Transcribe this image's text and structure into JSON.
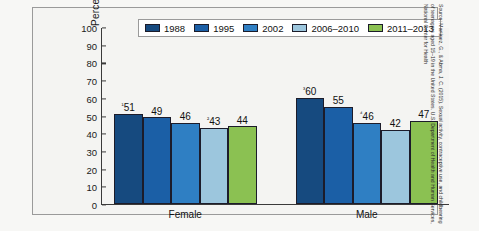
{
  "chart_data": {
    "type": "bar",
    "title": "",
    "xlabel": "",
    "ylabel": "Percent",
    "ylim": [
      0,
      100
    ],
    "ytick_step": 10,
    "yticks": [
      100,
      90,
      80,
      70,
      60,
      50,
      40,
      30,
      20,
      10,
      0
    ],
    "grid": false,
    "legend_position": "top-center",
    "categories": [
      "Female",
      "Male"
    ],
    "series": [
      {
        "name": "1988",
        "color": "#164a7f",
        "values": [
          51,
          60
        ],
        "labels": [
          "¹51",
          "³60"
        ]
      },
      {
        "name": "1995",
        "color": "#1b5fa6",
        "values": [
          49,
          55
        ],
        "labels": [
          "49",
          "55"
        ]
      },
      {
        "name": "2002",
        "color": "#2f7fc3",
        "values": [
          46,
          46
        ],
        "labels": [
          "46",
          "⁴ 46"
        ]
      },
      {
        "name": "2006–2010",
        "color": "#9cc6dd",
        "values": [
          43,
          42
        ],
        "labels": [
          "²43",
          "42"
        ]
      },
      {
        "name": "2011–2013",
        "color": "#8bc152",
        "values": [
          44,
          47
        ],
        "labels": [
          "44",
          "47"
        ]
      }
    ],
    "bar_labels": {
      "female": [
        "¹51",
        "49",
        "46",
        "²43",
        "44"
      ],
      "male": [
        "³60",
        "55",
        "⁴46",
        "42",
        "47"
      ]
    },
    "source": "Source: Martinez, G., & Abma, J. C. (2015). Sexual activity, contraceptive use, and childbearing of teenagers aged 15–19 in the United States. U.S. Department of Health and Human Services, National Center for Health"
  },
  "legend": {
    "items": [
      {
        "label": "1988",
        "color": "#164a7f"
      },
      {
        "label": "1995",
        "color": "#1b5fa6"
      },
      {
        "label": "2002",
        "color": "#2f7fc3"
      },
      {
        "label": "2006–2010",
        "color": "#9cc6dd"
      },
      {
        "label": "2011–2013",
        "color": "#8bc152"
      }
    ]
  },
  "axes": {
    "y_label": "Percent",
    "y_ticks": [
      "100",
      "90",
      "80",
      "70",
      "60",
      "50",
      "40",
      "30",
      "20",
      "10",
      "0"
    ],
    "x_groups": [
      "Female",
      "Male"
    ]
  },
  "values": {
    "female": {
      "y1988": "¹51",
      "y1995": "49",
      "y2002": "46",
      "y2006_2010": "²43",
      "y2011_2013": "44"
    },
    "male": {
      "y1988": "³60",
      "y1995": "55",
      "y2002": "⁴46",
      "y2006_2010": "42",
      "y2011_2013": "47"
    }
  },
  "source_note": "Source: Martinez, G., & Abma, J. C. (2015). Sexual activity, contraceptive use, and childbearing of teenagers aged 15–19 in the United States. U.S. Department of Health and Human Services, National Center for Health"
}
